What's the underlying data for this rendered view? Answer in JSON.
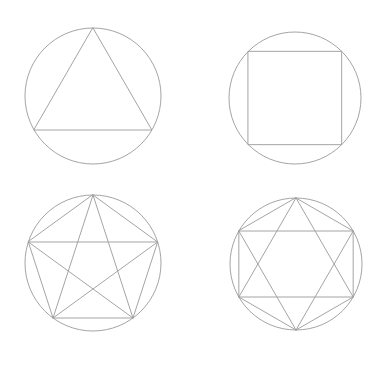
{
  "canvas": {
    "width": 388,
    "height": 369,
    "background_color": "#ffffff",
    "stroke_color": "#9a9a9a",
    "stroke_width": 0.9,
    "title": "Regular polygons and star polygons inscribed in circles",
    "layout": "2x2 grid of figures, no text labels visible"
  },
  "figures": [
    {
      "id": "figure-triangle",
      "name": "equilateral-triangle-in-circle",
      "position": "top-left",
      "circle": {
        "cx": 93,
        "cy": 96,
        "r": 68
      },
      "polygon": {
        "type": "triangle",
        "sides": 3,
        "rotation_deg": -90,
        "orientation": "apex-up",
        "vertex_count": 3,
        "diagonals_drawn": false
      },
      "description": "Equilateral triangle inscribed in a circle with apex at top"
    },
    {
      "id": "figure-square",
      "name": "square-in-circle",
      "position": "top-right",
      "circle": {
        "cx": 295,
        "cy": 98,
        "r": 66
      },
      "polygon": {
        "type": "square",
        "sides": 4,
        "rotation_deg": -135,
        "orientation": "axis-aligned",
        "vertex_count": 4,
        "diagonals_drawn": false
      },
      "description": "Square inscribed in a circle with horizontal top and bottom edges"
    },
    {
      "id": "figure-pentagram",
      "name": "pentagram-in-circle",
      "position": "bottom-left",
      "circle": {
        "cx": 93,
        "cy": 263,
        "r": 68
      },
      "polygon": {
        "type": "pentagon",
        "sides": 5,
        "rotation_deg": -90,
        "orientation": "apex-up",
        "vertex_count": 5,
        "diagonals_drawn": true,
        "star_step": 2,
        "star_name": "pentagram"
      },
      "description": "Regular pentagon inscribed in a circle with all diagonals drawn forming a five-pointed star"
    },
    {
      "id": "figure-hexagram",
      "name": "hexagram-in-circle",
      "position": "bottom-right",
      "circle": {
        "cx": 296,
        "cy": 264,
        "r": 66
      },
      "polygon": {
        "type": "hexagon",
        "sides": 6,
        "rotation_deg": -90,
        "orientation": "apex-up",
        "vertex_count": 6,
        "diagonals_drawn": true,
        "star_step": 2,
        "star_name": "hexagram"
      },
      "description": "Regular hexagon inscribed in a circle with two overlapping triangles forming a six-pointed star"
    }
  ]
}
